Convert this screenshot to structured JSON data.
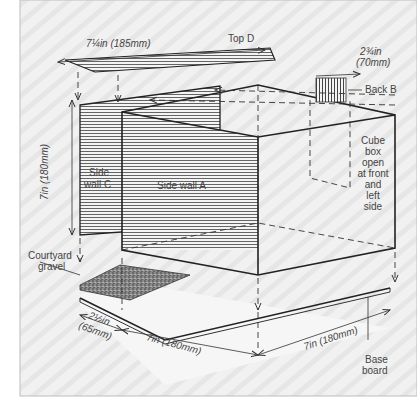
{
  "diagram": {
    "colors": {
      "panel_background": "#efefef",
      "panel_border": "#bdbdbd",
      "ink": "#333333",
      "label": "#444444"
    },
    "parts": {
      "top": "Top D",
      "back": "Back B",
      "side_c_line1": "Side",
      "side_c_line2": "wall C",
      "side_a": "Side wall A",
      "cube_lines": [
        "Cube",
        "box",
        "open",
        "at front",
        "and",
        "left",
        "side"
      ],
      "gravel_line1": "Courtyard",
      "gravel_line2": "gravel",
      "base_line1": "Base",
      "base_line2": "board"
    },
    "dimensions": {
      "top_width": "7¼in (185mm)",
      "back_width_line1": "2¾in",
      "back_width_line2": "(70mm)",
      "height": "7in (180mm)",
      "courtyard_depth_line1": "2½in",
      "courtyard_depth_line2": "(65mm)",
      "base_width": "7in (180mm)",
      "base_depth": "7in (180mm)"
    }
  }
}
